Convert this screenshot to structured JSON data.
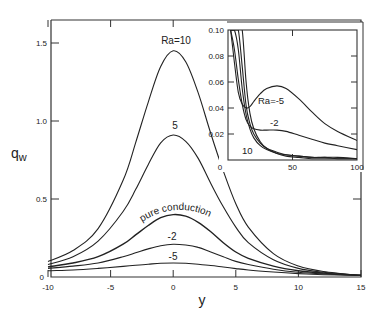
{
  "chart_data": [
    {
      "id": "main",
      "type": "line",
      "title": "",
      "xlabel": "y",
      "ylabel": "q_w",
      "xlim": [
        -10,
        15
      ],
      "ylim": [
        0,
        1.6
      ],
      "xticks": [
        -10,
        -5,
        0,
        5,
        10,
        15
      ],
      "yticks": [
        0,
        0.5,
        1.0,
        1.5
      ],
      "xtick_labels": [
        "-10",
        "-5",
        "0",
        "5",
        "10",
        "15"
      ],
      "ytick_labels": [
        "0",
        "0.5",
        "1.0",
        "1.5"
      ],
      "grid": false,
      "legend": "inline curve labels",
      "x": [
        -10,
        -8,
        -6,
        -4,
        -3,
        -2,
        -1,
        0,
        1,
        2,
        3,
        4,
        5,
        6,
        8,
        10,
        12,
        15
      ],
      "series": [
        {
          "name": "Ra=10",
          "label": "Ra=10",
          "values": [
            0.1,
            0.17,
            0.31,
            0.62,
            0.86,
            1.12,
            1.35,
            1.45,
            1.38,
            1.18,
            0.92,
            0.68,
            0.47,
            0.32,
            0.15,
            0.07,
            0.035,
            0.01
          ]
        },
        {
          "name": "Ra=5",
          "label": "5",
          "values": [
            0.08,
            0.13,
            0.23,
            0.42,
            0.56,
            0.72,
            0.86,
            0.91,
            0.87,
            0.76,
            0.6,
            0.45,
            0.32,
            0.22,
            0.11,
            0.055,
            0.03,
            0.01
          ]
        },
        {
          "name": "pure conduction",
          "label": "pure conduction",
          "values": [
            0.065,
            0.09,
            0.13,
            0.21,
            0.27,
            0.33,
            0.38,
            0.4,
            0.39,
            0.35,
            0.29,
            0.22,
            0.16,
            0.12,
            0.07,
            0.04,
            0.025,
            0.01
          ]
        },
        {
          "name": "Ra=-2",
          "label": "-2",
          "values": [
            0.055,
            0.07,
            0.09,
            0.13,
            0.155,
            0.18,
            0.2,
            0.21,
            0.205,
            0.19,
            0.16,
            0.13,
            0.1,
            0.08,
            0.05,
            0.03,
            0.02,
            0.01
          ]
        },
        {
          "name": "Ra=-5",
          "label": "-5",
          "values": [
            0.04,
            0.045,
            0.055,
            0.068,
            0.075,
            0.082,
            0.088,
            0.09,
            0.088,
            0.082,
            0.074,
            0.064,
            0.054,
            0.045,
            0.032,
            0.022,
            0.015,
            0.01
          ]
        }
      ],
      "annotations": [
        "Ra=10",
        "5",
        "pure conduction",
        "-2",
        "-5"
      ]
    },
    {
      "id": "inset",
      "type": "line",
      "title": "",
      "xlabel": "",
      "ylabel": "",
      "xlim": [
        0,
        100
      ],
      "ylim": [
        0,
        0.1
      ],
      "xticks": [
        0,
        50,
        100
      ],
      "yticks": [
        0,
        0.02,
        0.04,
        0.06,
        0.08,
        0.1
      ],
      "xtick_labels": [
        "0",
        "50",
        "100"
      ],
      "ytick_labels": [
        "0",
        "0.02",
        "0.04",
        "0.06",
        "0.08",
        "0.10"
      ],
      "grid": false,
      "legend": "inline curve labels",
      "position": "upper right, inside main axes",
      "x": [
        2,
        5,
        8,
        11,
        14,
        17,
        20,
        25,
        30,
        38,
        45,
        55,
        65,
        75,
        85,
        100
      ],
      "series": [
        {
          "name": "Ra=-5",
          "label": "Ra=-5",
          "values": [
            0.1,
            0.075,
            0.052,
            0.043,
            0.04,
            0.041,
            0.045,
            0.051,
            0.055,
            0.057,
            0.055,
            0.047,
            0.037,
            0.028,
            0.022,
            0.015
          ]
        },
        {
          "name": "Ra=-2",
          "label": "-2",
          "values": [
            0.1,
            0.085,
            0.062,
            0.043,
            0.031,
            0.026,
            0.024,
            0.023,
            0.023,
            0.023,
            0.022,
            0.019,
            0.016,
            0.013,
            0.011,
            0.008
          ]
        },
        {
          "name": "pure conduction",
          "label": "",
          "values": [
            0.1,
            0.1,
            0.085,
            0.055,
            0.035,
            0.024,
            0.017,
            0.011,
            0.008,
            0.005,
            0.004,
            0.003,
            0.002,
            0.002,
            0.002,
            0.001
          ]
        },
        {
          "name": "Ra=5",
          "label": "",
          "values": [
            0.1,
            0.1,
            0.1,
            0.072,
            0.042,
            0.028,
            0.02,
            0.013,
            0.009,
            0.006,
            0.004,
            0.003,
            0.002,
            0.002,
            0.001,
            0.001
          ]
        },
        {
          "name": "Ra=10",
          "label": "10",
          "values": [
            0.1,
            0.1,
            0.1,
            0.1,
            0.06,
            0.036,
            0.024,
            0.014,
            0.009,
            0.005,
            0.003,
            0.002,
            0.001,
            0.001,
            0.001,
            0.001
          ]
        }
      ],
      "annotations": [
        "Ra=-5",
        "-2",
        "10"
      ]
    }
  ],
  "labels": {
    "xlabel": "y",
    "ylabel_main": "q",
    "ylabel_sub": "w",
    "main_curve_labels": [
      "Ra=10",
      "5",
      "pure conduction",
      "-2",
      "-5"
    ],
    "inset_curve_labels": [
      "Ra=-5",
      "-2",
      "10"
    ]
  }
}
